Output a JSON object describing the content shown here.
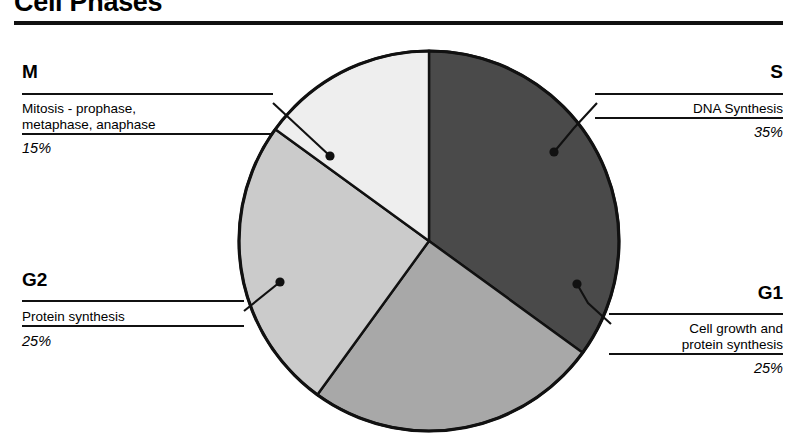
{
  "header": {
    "title": "Cell Phases"
  },
  "chart_data": {
    "type": "pie",
    "title": "Cell Phases",
    "categories": [
      "S",
      "G1",
      "G2",
      "M"
    ],
    "values": [
      35,
      25,
      25,
      15
    ],
    "labels": [
      "35%",
      "25%",
      "25%",
      "15%"
    ],
    "descriptions": [
      "DNA Synthesis",
      "Cell growth and protein synthesis",
      "Protein synthesis",
      "Mitosis - prophase, metaphase, anaphase"
    ],
    "colors": [
      "#4a4a4a",
      "#a8a8a8",
      "#cbcbcb",
      "#eeeeee"
    ],
    "stroke": "#111111",
    "start_angle_deg": 0,
    "direction": "clockwise",
    "legend": "callout-labels",
    "grid": false,
    "center": [
      429,
      241
    ],
    "radius": 190
  },
  "callouts": {
    "m": {
      "code": "M",
      "desc": "Mitosis - prophase,\nmetaphase, anaphase",
      "pct": "15%",
      "color": "#eeeeee"
    },
    "s": {
      "code": "S",
      "desc": "DNA Synthesis",
      "pct": "35%",
      "color": "#4a4a4a"
    },
    "g2": {
      "code": "G2",
      "desc": "Protein synthesis",
      "pct": "25%",
      "color": "#cbcbcb"
    },
    "g1": {
      "code": "G1",
      "desc": "Cell growth and\nprotein synthesis",
      "pct": "25%",
      "color": "#a8a8a8"
    }
  }
}
